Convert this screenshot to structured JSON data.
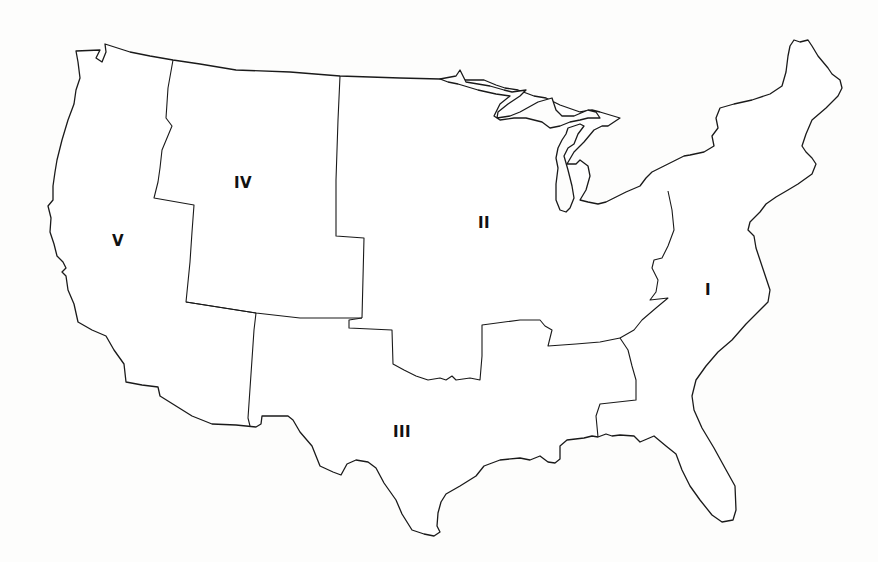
{
  "map": {
    "subject": "Contiguous United States divided into five regions",
    "regions": [
      {
        "id": "I",
        "label": "I",
        "x": 708,
        "y": 290
      },
      {
        "id": "II",
        "label": "II",
        "x": 484,
        "y": 223
      },
      {
        "id": "III",
        "label": "III",
        "x": 402,
        "y": 432
      },
      {
        "id": "IV",
        "label": "IV",
        "x": 243,
        "y": 183
      },
      {
        "id": "V",
        "label": "V",
        "x": 118,
        "y": 241
      }
    ],
    "colors": {
      "background": "#fdfdfc",
      "land": "#ffffff",
      "line": "#1a1a1a",
      "label": "#111111"
    }
  }
}
